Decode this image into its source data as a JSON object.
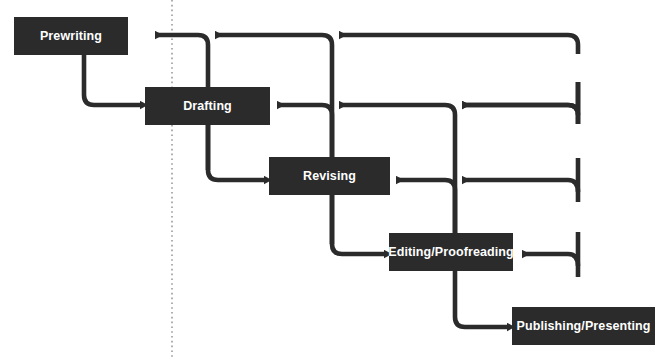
{
  "diagram": {
    "type": "flowchart",
    "orientation": "left-to-right cascading with recursive feedback loops",
    "background_color": "#ffffff",
    "node_fill_color": "#2b2b2b",
    "node_text_color": "#ffffff",
    "connector_color": "#2b2b2b",
    "nodes": [
      {
        "id": "prewriting",
        "label": "Prewriting",
        "order": 1,
        "x": 14,
        "y": 17,
        "width": 114,
        "height": 38
      },
      {
        "id": "drafting",
        "label": "Drafting",
        "order": 2,
        "x": 145,
        "y": 87,
        "width": 125,
        "height": 38
      },
      {
        "id": "revising",
        "label": "Revising",
        "order": 3,
        "x": 269,
        "y": 157,
        "width": 121,
        "height": 38
      },
      {
        "id": "editing",
        "label": "Editing/Proofreading",
        "order": 4,
        "x": 389,
        "y": 233,
        "width": 124,
        "height": 38
      },
      {
        "id": "publishing",
        "label": "Publishing/Presenting",
        "order": 5,
        "x": 512,
        "y": 307,
        "width": 143,
        "height": 38
      }
    ],
    "forward_connectors": [
      {
        "from": "prewriting",
        "to": "drafting",
        "style": "elbow-arrow"
      },
      {
        "from": "drafting",
        "to": "revising",
        "style": "elbow-arrow"
      },
      {
        "from": "revising",
        "to": "editing",
        "style": "elbow-arrow"
      },
      {
        "from": "editing",
        "to": "publishing",
        "style": "elbow-arrow"
      }
    ],
    "feedback_connectors": [
      {
        "from": "revising",
        "to": "drafting",
        "style": "elbow-arrow-back"
      },
      {
        "from": "revising",
        "to": "prewriting",
        "style": "elbow-arrow-back"
      },
      {
        "from": "editing",
        "to": "revising",
        "style": "elbow-arrow-back"
      },
      {
        "from": "editing",
        "to": "drafting",
        "style": "elbow-arrow-back"
      },
      {
        "from": "editing",
        "to": "prewriting",
        "style": "elbow-arrow-back"
      },
      {
        "from": "publishing",
        "to": "editing",
        "style": "elbow-arrow-back"
      },
      {
        "from": "publishing",
        "to": "revising",
        "style": "elbow-arrow-back"
      },
      {
        "from": "publishing",
        "to": "drafting",
        "style": "elbow-arrow-back"
      },
      {
        "from": "publishing",
        "to": "prewriting",
        "style": "elbow-arrow-back"
      }
    ],
    "guide": {
      "name": "vertical-dotted-guide",
      "x": 172,
      "color": "#8c8c8c",
      "style": "dotted"
    }
  }
}
